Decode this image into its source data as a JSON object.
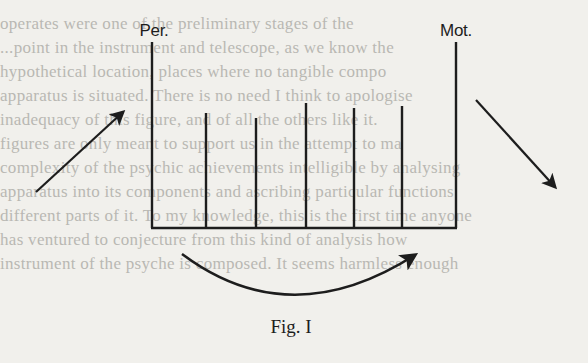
{
  "figure": {
    "labels": {
      "perceptual_end": "Per.",
      "motor_end": "Mot."
    },
    "caption": "Fig. I",
    "structure": {
      "outer_lines": [
        {
          "id": "per",
          "x": 152,
          "top": 42
        },
        {
          "id": "mot",
          "x": 456,
          "top": 42
        }
      ],
      "inner_lines": [
        {
          "x": 206,
          "top": 113
        },
        {
          "x": 256,
          "top": 118
        },
        {
          "x": 306,
          "top": 103
        },
        {
          "x": 354,
          "top": 108
        },
        {
          "x": 402,
          "top": 106
        }
      ],
      "baseline_y": 228
    },
    "arrows": [
      {
        "id": "input-arrow",
        "from": [
          36,
          192
        ],
        "to": [
          123,
          112
        ]
      },
      {
        "id": "output-arrow",
        "from": [
          476,
          100
        ],
        "to": [
          555,
          187
        ]
      },
      {
        "id": "curved-arrow",
        "from": [
          182,
          254
        ],
        "control": [
          290,
          335
        ],
        "to": [
          415,
          255
        ]
      }
    ],
    "stroke_color": "#1d1d1d",
    "background_color": "#f1f0ec"
  },
  "bleed_through_text": [
    {
      "y": 0,
      "text": ""
    },
    {
      "y": 14,
      "text": "operates were one of the preliminary stages of the"
    },
    {
      "y": 38,
      "text": "   ...point in the instrument and telescope, as we know the"
    },
    {
      "y": 62,
      "text": "   hypothetical location, places where no tangible compo"
    },
    {
      "y": 86,
      "text": "   apparatus is situated. There is no need I think to apologise"
    },
    {
      "y": 110,
      "text": "   inadequacy of this figure, and of all the others like it."
    },
    {
      "y": 134,
      "text": "   figures are only meant to support us in the attempt to ma"
    },
    {
      "y": 158,
      "text": "   complexity of the psychic achievements intelligible by analysing"
    },
    {
      "y": 182,
      "text": "   apparatus into its components and ascribing particular functions"
    },
    {
      "y": 206,
      "text": "   different parts of it. To my knowledge, this is the first time anyone"
    },
    {
      "y": 230,
      "text": "   has ventured to conjecture from this kind of analysis how"
    },
    {
      "y": 254,
      "text": "   instrument of the psyche is composed. It seems harmless enough"
    }
  ]
}
